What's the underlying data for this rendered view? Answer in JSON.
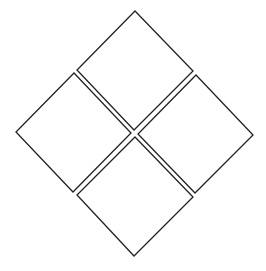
{
  "diagram": {
    "title": "",
    "type": "four-part hazard diamond (blank)",
    "stroke_color": "#222222",
    "fill_color": "#ffffff",
    "background": "#ffffff",
    "quadrants": [
      {
        "position": "top",
        "label": "",
        "points": "135,11 193,71 134,130 77,70"
      },
      {
        "position": "left",
        "label": "",
        "points": "74,73 131,133 73,192 16,132"
      },
      {
        "position": "right",
        "label": "",
        "points": "196,75 253,135 195,193 138,134"
      },
      {
        "position": "bottom",
        "label": "",
        "points": "135,137 193,197 134,256 77,195"
      }
    ]
  }
}
